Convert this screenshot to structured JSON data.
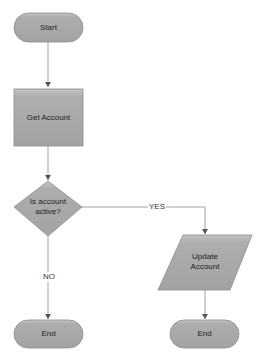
{
  "diagram": {
    "type": "flowchart",
    "colors": {
      "shape_fill": "#a9a9a9",
      "shape_top": "#c2c2c2",
      "shape_edge": "#8a8a8a",
      "line": "#7a7a7a",
      "text": "#222222",
      "background": "#ffffff"
    },
    "nodes": [
      {
        "id": "start",
        "shape": "terminator",
        "label": "Start"
      },
      {
        "id": "get_account",
        "shape": "process",
        "label": "Get Account"
      },
      {
        "id": "is_active",
        "shape": "decision",
        "label_line1": "Is account",
        "label_line2": "active?"
      },
      {
        "id": "update_account",
        "shape": "data",
        "label_line1": "Update",
        "label_line2": "Account"
      },
      {
        "id": "end_no",
        "shape": "terminator",
        "label": "End"
      },
      {
        "id": "end_yes",
        "shape": "terminator",
        "label": "End"
      }
    ],
    "edges": [
      {
        "from": "start",
        "to": "get_account",
        "label": ""
      },
      {
        "from": "get_account",
        "to": "is_active",
        "label": ""
      },
      {
        "from": "is_active",
        "to": "update_account",
        "label": "YES"
      },
      {
        "from": "is_active",
        "to": "end_no",
        "label": "NO"
      },
      {
        "from": "update_account",
        "to": "end_yes",
        "label": ""
      }
    ]
  }
}
